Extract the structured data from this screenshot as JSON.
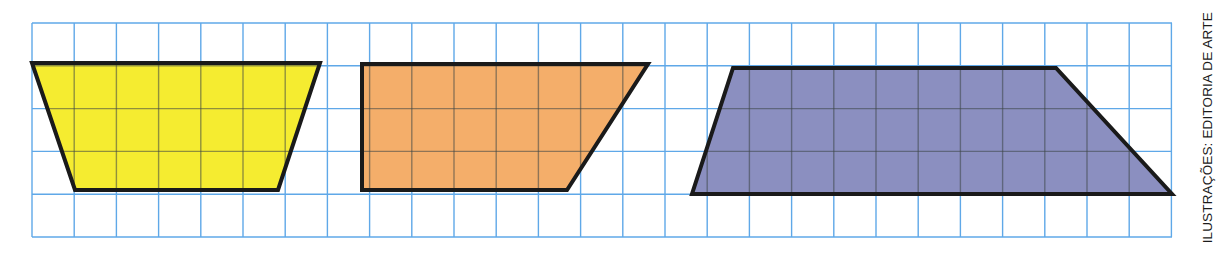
{
  "figure": {
    "background_color": "#ffffff",
    "width": 1223,
    "height": 256
  },
  "grid": {
    "name": "square-grid",
    "line_color": "#5fa8e8",
    "line_width": 1.4,
    "x_start": 32,
    "y_start": 23,
    "x_end": 1172,
    "y_end": 237,
    "columns": 27,
    "rows": 5,
    "cell_width": 42.2,
    "cell_height": 42.8
  },
  "shapes": [
    {
      "id": "yellow-trapezoid",
      "label": "Yellow trapezoid",
      "fill": "#f5ec30",
      "stroke": "#1a1a1a",
      "stroke_width": 4,
      "points": "32,63 320,63 278,190 75,190",
      "vertices": [
        {
          "x": 32,
          "y": 63
        },
        {
          "x": 320,
          "y": 63
        },
        {
          "x": 278,
          "y": 190
        },
        {
          "x": 75,
          "y": 190
        }
      ],
      "internal_grid": true
    },
    {
      "id": "orange-trapezoid",
      "label": "Orange trapezoid",
      "fill": "#f4ae6a",
      "stroke": "#1a1a1a",
      "stroke_width": 4,
      "points": "362,64 648,64 567,190 362,190",
      "vertices": [
        {
          "x": 362,
          "y": 64
        },
        {
          "x": 648,
          "y": 64
        },
        {
          "x": 567,
          "y": 190
        },
        {
          "x": 362,
          "y": 190
        }
      ],
      "internal_grid": true
    },
    {
      "id": "blue-trapezoid",
      "label": "Blue-violet trapezoid",
      "fill": "#8b8fc0",
      "stroke": "#1a1a1a",
      "stroke_width": 4,
      "points": "733,68 1056,68 1172,194 692,194",
      "vertices": [
        {
          "x": 733,
          "y": 68
        },
        {
          "x": 1056,
          "y": 68
        },
        {
          "x": 1172,
          "y": 194
        },
        {
          "x": 692,
          "y": 194
        }
      ],
      "internal_grid": true
    }
  ],
  "credit": {
    "text": "ILUSTRAÇÕES: EDITORIA DE ARTE",
    "color": "#1b1b1b",
    "rotation_deg": -90
  }
}
